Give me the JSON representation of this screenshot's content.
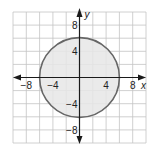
{
  "chart_data": {
    "type": "scatter",
    "title": "",
    "xlabel": "x",
    "ylabel": "y",
    "xlim": [
      -10,
      10
    ],
    "ylim": [
      -10,
      10
    ],
    "grid": true,
    "grid_step": 2,
    "x_ticks": [
      {
        "value": -8,
        "label": "−8"
      },
      {
        "value": -4,
        "label": "−4"
      },
      {
        "value": 4,
        "label": "4"
      },
      {
        "value": 8,
        "label": "8"
      }
    ],
    "y_ticks": [
      {
        "value": 8,
        "label": "8"
      },
      {
        "value": 4,
        "label": "4"
      },
      {
        "value": -4,
        "label": "−4"
      },
      {
        "value": -8,
        "label": "−8"
      }
    ],
    "series": [
      {
        "name": "circle",
        "shape": "circle",
        "equation": "x^2 + y^2 = 36",
        "center": [
          0,
          0
        ],
        "radius": 6,
        "filled": true,
        "fill_color": "#e6e6e6",
        "stroke_color": "#666666"
      }
    ],
    "legend": null
  },
  "colors": {
    "grid": "#c4c4c4",
    "axis": "#1a1a1a",
    "fill": "#e6e6e6",
    "stroke": "#666666"
  }
}
